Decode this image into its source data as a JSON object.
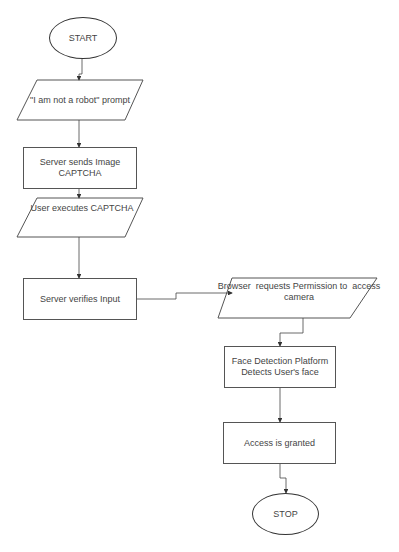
{
  "flowchart": {
    "nodes": [
      {
        "id": "start",
        "shape": "terminator",
        "label": "START"
      },
      {
        "id": "prompt",
        "shape": "parallelogram",
        "label": "\"I am not a robot\" prompt"
      },
      {
        "id": "send_captcha",
        "shape": "process",
        "label": "Server sends Image CAPTCHA",
        "lines": [
          "Server sends Image",
          "CAPTCHA"
        ]
      },
      {
        "id": "execute",
        "shape": "parallelogram",
        "label": "User executes CAPTCHA"
      },
      {
        "id": "verify",
        "shape": "process",
        "label": "Server verifies Input"
      },
      {
        "id": "permission",
        "shape": "parallelogram",
        "label": "Browser requests Permission to access camera",
        "lines": [
          "Browser  requests Permission to  access",
          "camera"
        ]
      },
      {
        "id": "face",
        "shape": "process",
        "label": "Face Detection Platform Detects User's face",
        "lines": [
          "Face Detection Platform",
          "Detects User's face"
        ]
      },
      {
        "id": "granted",
        "shape": "process",
        "label": "Access is granted"
      },
      {
        "id": "stop",
        "shape": "terminator",
        "label": "STOP"
      }
    ],
    "edges": [
      [
        "start",
        "prompt"
      ],
      [
        "prompt",
        "send_captcha"
      ],
      [
        "send_captcha",
        "execute"
      ],
      [
        "execute",
        "verify"
      ],
      [
        "verify",
        "permission"
      ],
      [
        "permission",
        "face"
      ],
      [
        "face",
        "granted"
      ],
      [
        "granted",
        "stop"
      ]
    ],
    "colors": {
      "stroke": "#444444",
      "text": "#444444",
      "background": "#ffffff"
    }
  }
}
